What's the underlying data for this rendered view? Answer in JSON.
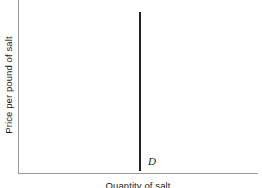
{
  "figure": {
    "background_color": "#ffffff",
    "width": 262,
    "height": 188
  },
  "axes": {
    "line_color": "#9a9a9a",
    "y_title": "Price per pound of salt",
    "x_title": "Quantity of salt"
  },
  "curves": {
    "demand": {
      "label": "D",
      "color": "#222222"
    }
  },
  "chart_data": {
    "type": "line",
    "title": "",
    "xlabel": "Quantity of salt",
    "ylabel": "Price per pound of salt",
    "grid": false,
    "legend": "none",
    "axis_ticks": {
      "x": [],
      "y": []
    },
    "xlim": [
      0,
      1
    ],
    "ylim": [
      0,
      1
    ],
    "series": [
      {
        "name": "D",
        "annotation": "D",
        "description": "Perfectly inelastic demand curve: vertical line at a fixed quantity",
        "x": [
          0.505,
          0.505
        ],
        "y": [
          0.012,
          0.93
        ],
        "color": "#222222"
      }
    ]
  }
}
